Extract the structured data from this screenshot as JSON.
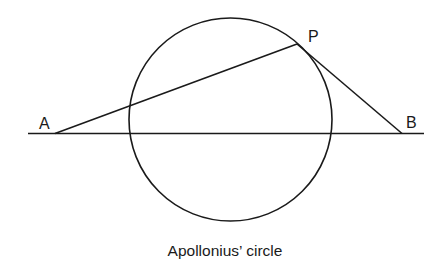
{
  "diagram": {
    "caption": "Apollonius’ circle",
    "stroke_color": "#1a1a1a",
    "points": {
      "A": {
        "label": "A",
        "x": 55,
        "y": 133
      },
      "B": {
        "label": "B",
        "x": 402,
        "y": 133
      },
      "P": {
        "label": "P",
        "x": 297,
        "y": 44
      }
    },
    "circle": {
      "cx": 230.5,
      "cy": 119,
      "r": 101
    },
    "baseline": {
      "x1": 28,
      "x2": 424,
      "y": 133.5
    },
    "segments": [
      "AP",
      "PB",
      "AB"
    ]
  }
}
